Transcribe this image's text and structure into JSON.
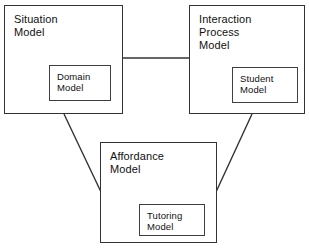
{
  "diagram": {
    "background_color": "#ffffff",
    "line_color": "#333333",
    "text_color": "#111111",
    "nodes": [
      {
        "id": "situation-model",
        "label": "Situation\nModel",
        "x": 4,
        "y": 5,
        "width": 119,
        "height": 109,
        "inner": {
          "id": "domain-model",
          "label": "Domain\nModel",
          "x": 44,
          "y": 59,
          "width": 62,
          "height": 36
        }
      },
      {
        "id": "interaction-process-model",
        "label": "Interaction\nProcess\nModel",
        "x": 189,
        "y": 5,
        "width": 116,
        "height": 109,
        "inner": {
          "id": "student-model",
          "label": "Student\nModel",
          "x": 42,
          "y": 61,
          "width": 66,
          "height": 36
        }
      },
      {
        "id": "affordance-model",
        "label": "Affordance\nModel",
        "x": 100,
        "y": 142,
        "width": 117,
        "height": 101,
        "inner": {
          "id": "tutoring-model",
          "label": "Tutoring\nModel",
          "x": 38,
          "y": 61,
          "width": 66,
          "height": 32
        }
      }
    ],
    "connectors": [
      {
        "id": "situation-to-interaction",
        "from": "situation-model",
        "to": "interaction-process-model",
        "type": "horizontal",
        "x1": 123,
        "y1": 58,
        "x2": 189,
        "y2": 58
      },
      {
        "id": "situation-to-affordance",
        "from": "situation-model",
        "to": "affordance-model",
        "type": "diagonal",
        "x1": 64,
        "y1": 114,
        "x2": 101,
        "y2": 192
      },
      {
        "id": "interaction-to-affordance",
        "from": "interaction-process-model",
        "to": "affordance-model",
        "type": "diagonal",
        "x1": 252,
        "y1": 114,
        "x2": 216,
        "y2": 192
      }
    ]
  }
}
